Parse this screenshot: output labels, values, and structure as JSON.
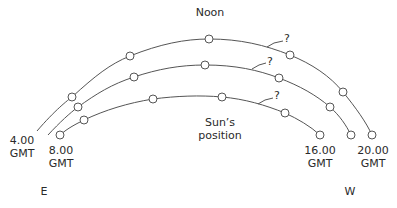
{
  "title": "Noon",
  "center_label": {
    "line1": "Sun’s",
    "line2": "position"
  },
  "time_labels": {
    "t4": {
      "time": "4.00",
      "zone": "GMT"
    },
    "t8": {
      "time": "8.00",
      "zone": "GMT"
    },
    "t16": {
      "time": "16.00",
      "zone": "GMT"
    },
    "t20": {
      "time": "20.00",
      "zone": "GMT"
    }
  },
  "directions": {
    "east": "E",
    "west": "W"
  },
  "unknown_markers": [
    "?",
    "?",
    "?"
  ],
  "arcs": [
    {
      "name": "outer-arc",
      "start_label": "4.00 GMT",
      "end_label": "20.00 GMT",
      "points": [
        [
          72,
          97
        ],
        [
          130,
          56
        ],
        [
          209,
          39
        ],
        [
          290,
          55
        ],
        [
          343,
          92
        ],
        [
          372,
          135
        ]
      ]
    },
    {
      "name": "middle-arc",
      "points": [
        [
          78,
          107
        ],
        [
          134,
          77
        ],
        [
          205,
          65
        ],
        [
          279,
          78
        ],
        [
          330,
          107
        ],
        [
          351,
          135
        ]
      ]
    },
    {
      "name": "inner-arc",
      "start_label": "8.00 GMT",
      "end_label": "16.00 GMT",
      "points": [
        [
          60,
          135
        ],
        [
          84,
          120
        ],
        [
          153,
          99
        ],
        [
          222,
          97
        ],
        [
          285,
          113
        ],
        [
          320,
          135
        ]
      ]
    }
  ],
  "colors": {
    "line": "#555555",
    "text": "#2a2a2a",
    "background": "#ffffff"
  }
}
